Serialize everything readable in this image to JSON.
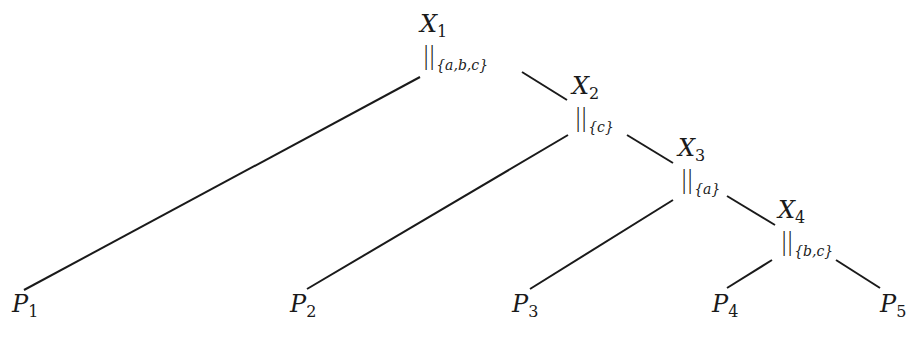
{
  "diagram": {
    "type": "binary-tree",
    "colors": {
      "edge": "#1a1a1a",
      "text": "#1a1a1a",
      "background": "#ffffff"
    },
    "nodes": [
      {
        "id": "X1",
        "name": "X",
        "sub": "1",
        "op": "||",
        "sync": "{a,b,c}",
        "x": 420,
        "y": 12
      },
      {
        "id": "X2",
        "name": "X",
        "sub": "2",
        "op": "||",
        "sync": "{c}",
        "x": 572,
        "y": 74
      },
      {
        "id": "X3",
        "name": "X",
        "sub": "3",
        "op": "||",
        "sync": "{a}",
        "x": 678,
        "y": 136
      },
      {
        "id": "X4",
        "name": "X",
        "sub": "4",
        "op": "||",
        "sync": "{b,c}",
        "x": 778,
        "y": 198
      }
    ],
    "leaves": [
      {
        "id": "P1",
        "name": "P",
        "sub": "1",
        "x": 12,
        "y": 292
      },
      {
        "id": "P2",
        "name": "P",
        "sub": "2",
        "x": 290,
        "y": 292
      },
      {
        "id": "P3",
        "name": "P",
        "sub": "3",
        "x": 512,
        "y": 292
      },
      {
        "id": "P4",
        "name": "P",
        "sub": "4",
        "x": 712,
        "y": 292
      },
      {
        "id": "P5",
        "name": "P",
        "sub": "5",
        "x": 880,
        "y": 292
      }
    ],
    "edges": [
      {
        "from": "X1",
        "to": "P1",
        "x1": 420,
        "y1": 77,
        "x2": 24,
        "y2": 290
      },
      {
        "from": "X1",
        "to": "X2",
        "x1": 522,
        "y1": 72,
        "x2": 567,
        "y2": 100
      },
      {
        "from": "X2",
        "to": "P2",
        "x1": 568,
        "y1": 135,
        "x2": 307,
        "y2": 289
      },
      {
        "from": "X2",
        "to": "X3",
        "x1": 627,
        "y1": 135,
        "x2": 673,
        "y2": 163
      },
      {
        "from": "X3",
        "to": "P3",
        "x1": 673,
        "y1": 200,
        "x2": 530,
        "y2": 289
      },
      {
        "from": "X3",
        "to": "X4",
        "x1": 727,
        "y1": 196,
        "x2": 775,
        "y2": 225
      },
      {
        "from": "X4",
        "to": "P4",
        "x1": 772,
        "y1": 260,
        "x2": 727,
        "y2": 288
      },
      {
        "from": "X4",
        "to": "P5",
        "x1": 836,
        "y1": 260,
        "x2": 880,
        "y2": 288
      }
    ]
  }
}
